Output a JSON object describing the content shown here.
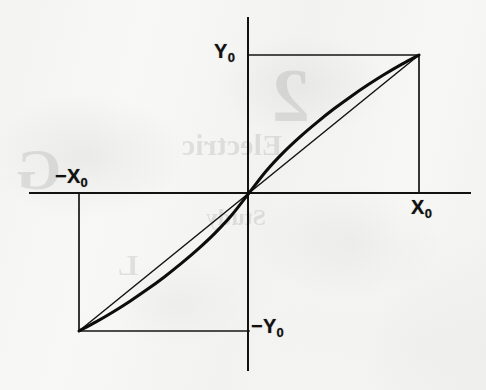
{
  "figure": {
    "background_color": "#f6f6f4",
    "ink_color": "#111111"
  },
  "labels": {
    "y_positive": {
      "symbol": "Y",
      "subscript": "0",
      "text": "Y0"
    },
    "y_negative": {
      "symbol": "−Y",
      "subscript": "0",
      "text": "−Y0"
    },
    "x_positive": {
      "symbol": "X",
      "subscript": "0",
      "text": "X0"
    },
    "x_negative": {
      "symbol": "−X",
      "subscript": "0",
      "text": "−X0"
    }
  },
  "ghost_text": [
    {
      "text": "Electric",
      "left": 182,
      "top": 128,
      "size": 30
    },
    {
      "text": "Study",
      "left": 206,
      "top": 204,
      "size": 24
    },
    {
      "text": "2",
      "left": 272,
      "top": 52,
      "size": 76
    },
    {
      "text": "G",
      "left": 16,
      "top": 136,
      "size": 58
    },
    {
      "text": "L",
      "left": 118,
      "top": 248,
      "size": 30
    }
  ],
  "chart_data": {
    "type": "line",
    "title": "",
    "xlabel": "",
    "ylabel": "",
    "xlim": [
      -1,
      1
    ],
    "ylim": [
      -1,
      1
    ],
    "grid": false,
    "legend": "none",
    "axes": {
      "x_axis": {
        "y": 0,
        "x_start_px": 30,
        "x_end_px": 470,
        "y_px": 193
      },
      "y_axis": {
        "x": 0,
        "y_start_px": 18,
        "y_end_px": 370,
        "x_px": 248
      },
      "origin_px": [
        249,
        193
      ],
      "x0_px": 419,
      "y0_px": 55,
      "neg_x0_px": 78,
      "neg_y0_px": 328
    },
    "tick_labels": {
      "x": [
        "−X0",
        "X0"
      ],
      "y": [
        "−Y0",
        "Y0"
      ]
    },
    "series": [
      {
        "name": "saturating characteristic",
        "style": "bold-curve",
        "line_width": 3.1,
        "description": "odd-symmetric concave curve through origin, steep near origin, flattening to the corner points",
        "x": [
          -1.0,
          -0.9,
          -0.8,
          -0.7,
          -0.6,
          -0.5,
          -0.4,
          -0.3,
          -0.2,
          -0.1,
          0.0,
          0.1,
          0.2,
          0.3,
          0.4,
          0.5,
          0.6,
          0.7,
          0.8,
          0.9,
          1.0
        ],
        "y": [
          -1.0,
          -0.934,
          -0.862,
          -0.784,
          -0.7,
          -0.61,
          -0.512,
          -0.407,
          -0.291,
          -0.158,
          0.0,
          0.158,
          0.291,
          0.407,
          0.512,
          0.61,
          0.7,
          0.784,
          0.862,
          0.934,
          1.0
        ]
      },
      {
        "name": "ideal linear reference",
        "style": "thin-line",
        "line_width": 1.5,
        "description": "straight chord from (-X0,-Y0) through origin to (X0,Y0)",
        "x": [
          -1.0,
          0.0,
          1.0
        ],
        "y": [
          -1.0,
          0.0,
          1.0
        ]
      }
    ],
    "annotations": [
      {
        "type": "construction-line",
        "name": "y0-horizontal",
        "from": [
          0,
          1
        ],
        "to": [
          1,
          1
        ]
      },
      {
        "type": "construction-line",
        "name": "x0-vertical",
        "from": [
          1,
          1
        ],
        "to": [
          1,
          0
        ]
      },
      {
        "type": "construction-line",
        "name": "neg-y0-horizontal",
        "from": [
          -1,
          -1
        ],
        "to": [
          0,
          -1
        ]
      },
      {
        "type": "construction-line",
        "name": "neg-x0-vertical",
        "from": [
          -1,
          0
        ],
        "to": [
          -1,
          -1
        ]
      }
    ]
  }
}
